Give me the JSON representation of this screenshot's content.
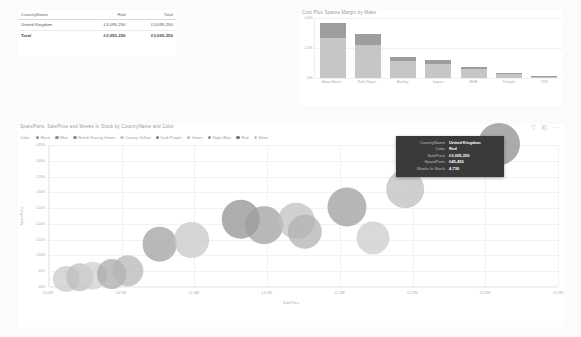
{
  "table": {
    "name": "sales-by-country-table",
    "columns": [
      "CountryName",
      "Red",
      "Total"
    ],
    "rows": [
      {
        "country": "United Kingdom",
        "red": "£3,095,250",
        "total": "£3,095,250"
      }
    ],
    "total_row": {
      "label": "Total",
      "red": "£3,095,250",
      "total": "£3,095,250"
    }
  },
  "bar_visual": {
    "title": "Cost Plus Spares Margin by Make"
  },
  "scatter_visual": {
    "title": "SpareParts, SalePrice and Weeks In Stock by CountryName and Color",
    "legend_title": "Color",
    "legend": [
      {
        "label": "Black",
        "color": "#8e8e8e"
      },
      {
        "label": "Blue",
        "color": "#8e8e8e"
      },
      {
        "label": "British Racing Green",
        "color": "#8e8e8e"
      },
      {
        "label": "Canary Yellow",
        "color": "#c9c9c9"
      },
      {
        "label": "Dark Purple",
        "color": "#7d7d7d"
      },
      {
        "label": "Green",
        "color": "#bdbdbd"
      },
      {
        "label": "Night Blue",
        "color": "#8a8a8a"
      },
      {
        "label": "Red",
        "color": "#6f6f6f"
      },
      {
        "label": "Silver",
        "color": "#c4c4c4"
      }
    ],
    "icons": [
      {
        "name": "filter-icon",
        "glyph": "filter"
      },
      {
        "name": "focus-mode-icon",
        "glyph": "focus"
      },
      {
        "name": "more-options-icon",
        "glyph": "ellipsis"
      }
    ]
  },
  "tooltip": {
    "name": "scatter-tooltip",
    "rows": [
      {
        "key": "CountryName",
        "value": "United Kingdom"
      },
      {
        "key": "Color",
        "value": "Red"
      },
      {
        "key": "SalePrice",
        "value": "£3,095,250"
      },
      {
        "key": "SpareParts",
        "value": "£45,450"
      },
      {
        "key": "Weeks In Stock",
        "value": "4,730"
      }
    ]
  },
  "chart_data": [
    {
      "type": "bar",
      "title": "Cost Plus Spares Margin by Make",
      "xlabel": "",
      "ylabel": "",
      "categories": [
        "Aston Martin",
        "Rolls Royce",
        "Bentley",
        "Jaguar",
        "MGB",
        "Triumph",
        "TVR"
      ],
      "tick_labels": [
        "£0K",
        "£20K",
        "£40K"
      ],
      "ylim": [
        0,
        44000
      ],
      "grid": true,
      "legend_position": "none",
      "series": [
        {
          "name": "Cost",
          "values": [
            29000,
            24000,
            12500,
            10500,
            6500,
            3200,
            900
          ]
        },
        {
          "name": "Spares Margin",
          "values": [
            11000,
            8500,
            3000,
            2500,
            1500,
            800,
            300
          ]
        }
      ]
    },
    {
      "type": "scatter",
      "title": "SpareParts, SalePrice and Weeks In Stock by CountryName and Color",
      "xlabel": "SalePrice",
      "ylabel": "SpareParts",
      "xlim": [
        0,
        3500000
      ],
      "ylim": [
        0,
        45000
      ],
      "xtick_labels": [
        "£0.0M",
        "£0.5M",
        "£1.0M",
        "£1.5M",
        "£2.0M",
        "£2.5M",
        "£3.0M",
        "£3.5M"
      ],
      "ytick_labels": [
        "£0K",
        "£5K",
        "£10K",
        "£15K",
        "£20K",
        "£25K",
        "£30K",
        "£35K",
        "£40K",
        "£45K"
      ],
      "grid": true,
      "legend_position": "top",
      "size_field": "Weeks In Stock",
      "points": [
        {
          "color_label": "Silver",
          "x": 120000,
          "y": 2600,
          "size": 900,
          "color": "#c9c9c9"
        },
        {
          "color_label": "Green",
          "x": 210000,
          "y": 3100,
          "size": 1100,
          "color": "#bdbdbd"
        },
        {
          "color_label": "Canary Yellow",
          "x": 300000,
          "y": 3600,
          "size": 1300,
          "color": "#cfcfcf"
        },
        {
          "color_label": "Black",
          "x": 430000,
          "y": 4200,
          "size": 1500,
          "color": "#a8a8a8"
        },
        {
          "color_label": "Blue",
          "x": 540000,
          "y": 5200,
          "size": 1800,
          "color": "#b4b4b4"
        },
        {
          "color_label": "Night Blue",
          "x": 760000,
          "y": 13500,
          "size": 2600,
          "color": "#9e9e9e"
        },
        {
          "color_label": "Green",
          "x": 980000,
          "y": 14800,
          "size": 2900,
          "color": "#c6c6c6"
        },
        {
          "color_label": "Dark Purple",
          "x": 1320000,
          "y": 21500,
          "size": 3600,
          "color": "#8f8f8f"
        },
        {
          "color_label": "British Racing Green",
          "x": 1480000,
          "y": 19500,
          "size": 3400,
          "color": "#9c9c9c"
        },
        {
          "color_label": "Canary Yellow",
          "x": 1700000,
          "y": 21000,
          "size": 3000,
          "color": "#bfbfbf"
        },
        {
          "color_label": "Blue",
          "x": 1760000,
          "y": 17500,
          "size": 2500,
          "color": "#b0b0b0"
        },
        {
          "color_label": "Black",
          "x": 2050000,
          "y": 25500,
          "size": 3800,
          "color": "#9a9a9a"
        },
        {
          "color_label": "Silver",
          "x": 2230000,
          "y": 15500,
          "size": 2200,
          "color": "#cbcbcb"
        },
        {
          "color_label": "Green",
          "x": 2450000,
          "y": 31000,
          "size": 3400,
          "color": "#bdbdbd"
        },
        {
          "color_label": "Red",
          "x": 3095250,
          "y": 45450,
          "size": 4730,
          "color": "#8b8b8b"
        }
      ]
    }
  ]
}
